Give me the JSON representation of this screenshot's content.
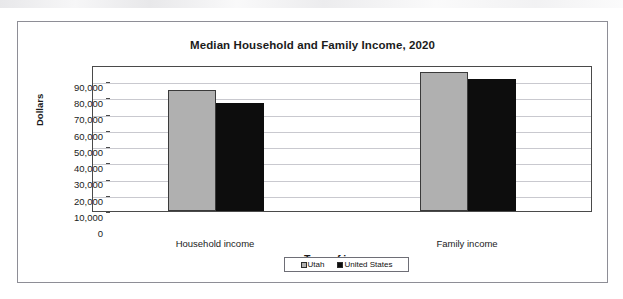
{
  "chart_data": {
    "type": "bar",
    "title": "Median Household and Family Income, 2020",
    "xlabel": "Type of income",
    "ylabel": "Dollars",
    "categories": [
      "Household income",
      "Family income"
    ],
    "series": [
      {
        "name": "Utah",
        "color": "#b0b0b0",
        "values": [
          74500,
          85700
        ]
      },
      {
        "name": "United States",
        "color": "#0d0d0d",
        "values": [
          66500,
          81400
        ]
      }
    ],
    "ylim": [
      0,
      90000
    ],
    "ytick_step": 10000,
    "ytick_labels": [
      "90,000",
      "80,000",
      "70,000",
      "60,000",
      "50,000",
      "40,000",
      "30,000",
      "20,000",
      "10,000",
      "0"
    ],
    "ytick_values": [
      90000,
      80000,
      70000,
      60000,
      50000,
      40000,
      30000,
      20000,
      10000,
      0
    ],
    "grid": true,
    "legend_position": "bottom",
    "legend_entries": [
      "Utah",
      "United States"
    ]
  }
}
